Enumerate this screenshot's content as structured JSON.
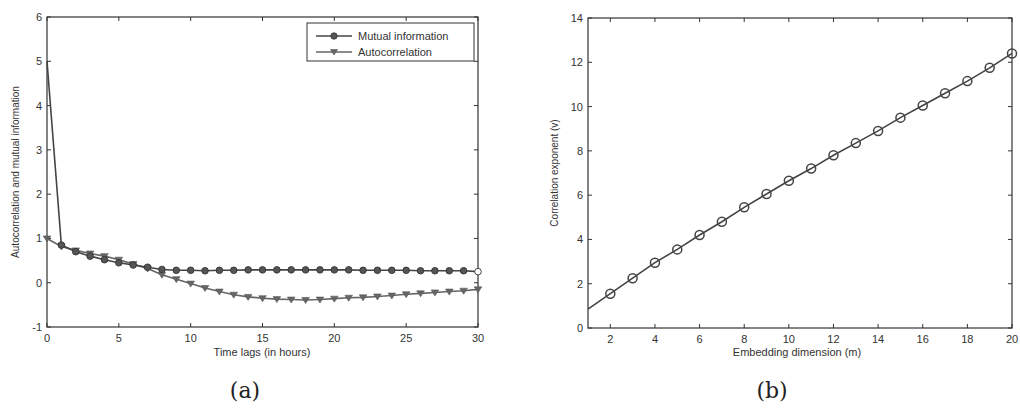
{
  "chart_data": [
    {
      "id": "a",
      "type": "line",
      "caption": "(a)",
      "xlabel": "Time lags (in hours)",
      "ylabel": "Autocorrelation and mutual information",
      "xlim": [
        0,
        30
      ],
      "ylim": [
        -1,
        6
      ],
      "xticks": [
        0,
        5,
        10,
        15,
        20,
        25,
        30
      ],
      "yticks": [
        -1,
        0,
        1,
        2,
        3,
        4,
        5,
        6
      ],
      "grid": false,
      "legend_position": "upper right",
      "x": [
        0,
        1,
        2,
        3,
        4,
        5,
        6,
        7,
        8,
        9,
        10,
        11,
        12,
        13,
        14,
        15,
        16,
        17,
        18,
        19,
        20,
        21,
        22,
        23,
        24,
        25,
        26,
        27,
        28,
        29,
        30
      ],
      "series": [
        {
          "name": "Mutual information",
          "marker": "circle",
          "values": [
            5.0,
            0.85,
            0.7,
            0.6,
            0.52,
            0.45,
            0.4,
            0.35,
            0.3,
            0.28,
            0.28,
            0.27,
            0.28,
            0.28,
            0.29,
            0.29,
            0.29,
            0.29,
            0.29,
            0.29,
            0.29,
            0.29,
            0.28,
            0.28,
            0.28,
            0.28,
            0.27,
            0.27,
            0.27,
            0.27,
            0.25
          ]
        },
        {
          "name": "Autocorrelation",
          "marker": "triangle-down",
          "values": [
            1.0,
            0.82,
            0.73,
            0.66,
            0.6,
            0.52,
            0.42,
            0.32,
            0.18,
            0.08,
            -0.02,
            -0.12,
            -0.2,
            -0.27,
            -0.32,
            -0.35,
            -0.37,
            -0.38,
            -0.39,
            -0.38,
            -0.36,
            -0.34,
            -0.33,
            -0.31,
            -0.29,
            -0.26,
            -0.24,
            -0.22,
            -0.2,
            -0.18,
            -0.15
          ]
        }
      ]
    },
    {
      "id": "b",
      "type": "line",
      "caption": "(b)",
      "xlabel": "Embedding dimension (m)",
      "ylabel": "Correlation exponent (v)",
      "xlim": [
        1,
        20
      ],
      "ylim": [
        0,
        14
      ],
      "xticks": [
        2,
        4,
        6,
        8,
        10,
        12,
        14,
        16,
        18,
        20
      ],
      "yticks": [
        0,
        2,
        4,
        6,
        8,
        10,
        12,
        14
      ],
      "grid": false,
      "line_start": {
        "x": 1,
        "y": 0.85
      },
      "x": [
        2,
        3,
        4,
        5,
        6,
        7,
        8,
        9,
        10,
        11,
        12,
        13,
        14,
        15,
        16,
        17,
        18,
        19,
        20
      ],
      "series": [
        {
          "name": "Correlation exponent",
          "marker": "open-circle",
          "values": [
            1.55,
            2.25,
            2.95,
            3.55,
            4.2,
            4.8,
            5.45,
            6.05,
            6.65,
            7.2,
            7.8,
            8.35,
            8.9,
            9.5,
            10.05,
            10.6,
            11.15,
            11.75,
            12.4
          ]
        }
      ]
    }
  ],
  "colors": {
    "axis": "#333333",
    "series_mi": "#444444",
    "series_ac": "#666666",
    "series_b": "#444444"
  }
}
